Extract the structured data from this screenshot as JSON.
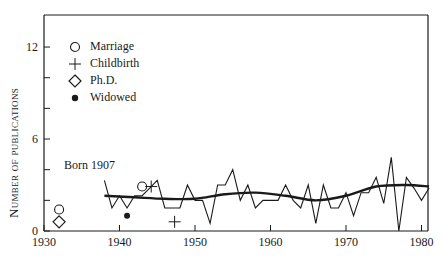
{
  "chart_data": {
    "type": "line",
    "title": "",
    "xlabel": "",
    "ylabel": "Number of publications",
    "xlim": [
      1930,
      1981
    ],
    "ylim": [
      0,
      14
    ],
    "x_ticks": [
      1930,
      1940,
      1950,
      1960,
      1970,
      1980
    ],
    "y_ticks": [
      0,
      2,
      4,
      6,
      8,
      10,
      12
    ],
    "y_tick_labels": [
      "0",
      "",
      "",
      "6",
      "",
      "",
      "12"
    ],
    "grid": false,
    "legend_position": "upper-left",
    "series": [
      {
        "name": "Publications per year",
        "style": "thin-line",
        "x": [
          1938,
          1939,
          1940,
          1941,
          1942,
          1943,
          1944,
          1945,
          1946,
          1947,
          1948,
          1949,
          1950,
          1951,
          1952,
          1953,
          1954,
          1955,
          1956,
          1957,
          1958,
          1959,
          1960,
          1961,
          1962,
          1963,
          1964,
          1965,
          1966,
          1967,
          1968,
          1969,
          1970,
          1971,
          1972,
          1973,
          1974,
          1975,
          1976,
          1977,
          1978,
          1979,
          1980,
          1981
        ],
        "values": [
          3.3,
          1.5,
          2.3,
          1.5,
          2.3,
          2.3,
          2.8,
          3.3,
          1.5,
          1.5,
          1.5,
          3.0,
          2.0,
          2.0,
          0.5,
          3.0,
          3.0,
          4.0,
          2.0,
          3.0,
          1.5,
          2.0,
          2.0,
          2.0,
          3.0,
          2.0,
          1.5,
          3.0,
          0.5,
          3.0,
          1.5,
          1.5,
          2.5,
          1.0,
          2.5,
          2.5,
          3.5,
          1.8,
          4.8,
          0.0,
          3.5,
          2.8,
          2.0,
          2.8
        ]
      },
      {
        "name": "Smoothed trend",
        "style": "thick-line",
        "x": [
          1938,
          1942,
          1946,
          1950,
          1954,
          1958,
          1962,
          1966,
          1970,
          1974,
          1978,
          1981
        ],
        "values": [
          2.3,
          2.2,
          2.1,
          2.1,
          2.4,
          2.5,
          2.3,
          2.0,
          2.3,
          2.9,
          3.0,
          2.9
        ]
      }
    ],
    "markers": [
      {
        "event": "Marriage",
        "symbol": "open-circle",
        "x": 1932,
        "y": 1.4
      },
      {
        "event": "Marriage",
        "symbol": "open-circle",
        "x": 1943,
        "y": 2.9
      },
      {
        "event": "Childbirth",
        "symbol": "plus",
        "x": 1944.2,
        "y": 2.9
      },
      {
        "event": "Childbirth",
        "symbol": "plus",
        "x": 1947.3,
        "y": 0.6
      },
      {
        "event": "Ph.D.",
        "symbol": "open-diamond",
        "x": 1932,
        "y": 0.6
      },
      {
        "event": "Widowed",
        "symbol": "filled-dot",
        "x": 1941,
        "y": 1.0
      }
    ],
    "legend": [
      "Marriage",
      "Childbirth",
      "Ph.D.",
      "Widowed"
    ],
    "annotations": [
      {
        "text": "Born 1907",
        "x": 1932,
        "y": 3.8
      }
    ]
  },
  "legend": {
    "items": [
      {
        "label": "Marriage",
        "icon": "open-circle"
      },
      {
        "label": "Childbirth",
        "icon": "plus"
      },
      {
        "label": "Ph.D.",
        "icon": "open-diamond"
      },
      {
        "label": "Widowed",
        "icon": "filled-dot"
      }
    ]
  },
  "axis": {
    "ylabel": "Number of publications",
    "x_labels": [
      "1930",
      "1940",
      "1950",
      "1960",
      "1970",
      "1980"
    ],
    "y_labels": {
      "0": "0",
      "6": "6",
      "12": "12"
    }
  },
  "annotation": {
    "born": "Born 1907"
  }
}
